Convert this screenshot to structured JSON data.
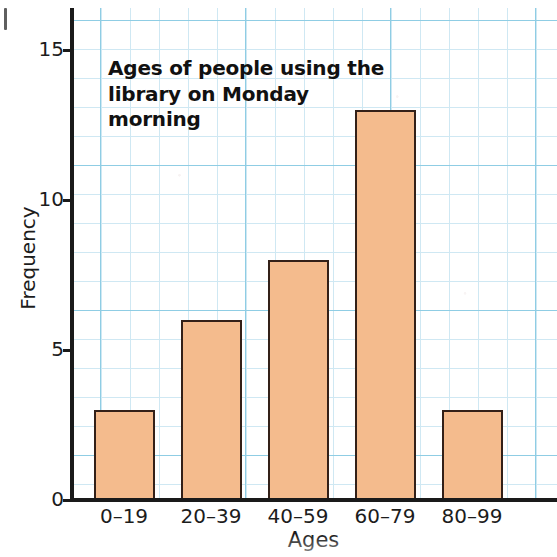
{
  "chart_data": {
    "type": "bar",
    "title": "Ages of people using the library on Monday morning",
    "title_line1": "Ages of people using the",
    "title_line2": "library on Monday morning",
    "xlabel": "Ages",
    "ylabel": "Frequency",
    "categories": [
      "0–19",
      "20–39",
      "40–59",
      "60–79",
      "80–99"
    ],
    "values": [
      3,
      6,
      8,
      13,
      3
    ],
    "ylim": [
      0,
      16
    ],
    "ytick_labels": [
      "0",
      "5",
      "10",
      "15"
    ],
    "ytick_values": [
      0,
      5,
      10,
      15
    ],
    "grid": true,
    "grid_style": "graph paper, minor cells = 1 frequency unit, major every 5 cells",
    "legend": null,
    "bar_fill_color": "#f4bb8d",
    "bar_edge_color": "#332018",
    "grid_minor_color": "#cfe8f3",
    "grid_major_color": "#8fcde4",
    "axis_color": "#1a1a1a",
    "text_color": "#1c1c1c"
  }
}
